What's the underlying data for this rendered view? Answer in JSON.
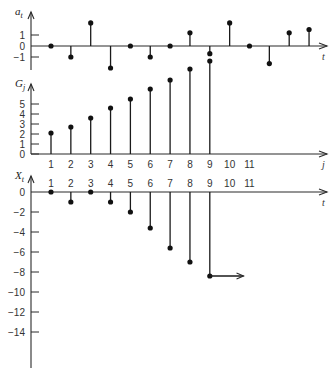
{
  "chart_data": [
    {
      "type": "stem",
      "id": "a_t",
      "title": "",
      "ylabel": "a_t",
      "xlabel": "t",
      "ylim": [
        -2,
        3
      ],
      "yticks": [
        1,
        0,
        -1
      ],
      "ytick_labels": [
        "1",
        "0",
        "−1"
      ],
      "x": [
        1,
        2,
        3,
        4,
        5,
        6,
        7,
        8,
        9,
        10,
        11,
        12,
        13,
        14
      ],
      "values": [
        0,
        -1,
        2.1,
        -2,
        0,
        -1,
        0,
        1.2,
        -0.7,
        2.1,
        0,
        -1.6,
        1.2,
        1.5
      ],
      "grid": false
    },
    {
      "type": "stem",
      "id": "G_j",
      "title": "",
      "ylabel": "G_j",
      "xlabel": "j",
      "ylim": [
        0,
        10
      ],
      "yticks": [
        5,
        4,
        3,
        2,
        1,
        0
      ],
      "ytick_labels": [
        "5",
        "4",
        "3",
        "2",
        "1",
        "0"
      ],
      "categories": [
        "1",
        "2",
        "3",
        "4",
        "5",
        "6",
        "7",
        "8",
        "9",
        "10",
        "11"
      ],
      "x": [
        1,
        2,
        3,
        4,
        5,
        6,
        7,
        8,
        9
      ],
      "values": [
        2.1,
        2.7,
        3.6,
        4.6,
        5.5,
        6.5,
        7.4,
        8.5,
        9.3
      ],
      "grid": false
    },
    {
      "type": "stem",
      "id": "X_t",
      "title": "",
      "ylabel": "X_t",
      "xlabel": "t",
      "ylim": [
        -17,
        1
      ],
      "yticks": [
        0,
        -2,
        -4,
        -6,
        -8,
        -10,
        -12,
        -14
      ],
      "ytick_labels": [
        "0",
        "−2",
        "−4",
        "−6",
        "−8",
        "−10",
        "−12",
        "−14"
      ],
      "categories": [
        "1",
        "2",
        "3",
        "4",
        "5",
        "6",
        "7",
        "8",
        "9",
        "10",
        "11"
      ],
      "x": [
        1,
        2,
        3,
        4,
        5,
        6,
        7,
        8,
        9
      ],
      "values": [
        0,
        -1,
        0,
        -1,
        -2,
        -3.6,
        -5.6,
        -7,
        -8.4
      ],
      "annotations": [
        {
          "type": "arrow",
          "from_x": 9,
          "to_x": 10.7,
          "y": -8.4
        }
      ],
      "grid": false
    }
  ],
  "layout": {
    "axis_x": 31,
    "x0": 51,
    "dx": 19.85,
    "axis_end_x": 327,
    "panels": [
      {
        "zero_y": 46,
        "unit_px": 11,
        "top_y": 12,
        "bottom_y": 70
      },
      {
        "zero_y": 154,
        "unit_px": 10,
        "top_y": 84,
        "bottom_y": 154,
        "label_row_y": 168
      },
      {
        "zero_y": 192,
        "unit_px": 10,
        "top_y": 176,
        "bottom_y": 368,
        "label_row_y": 187
      }
    ]
  }
}
